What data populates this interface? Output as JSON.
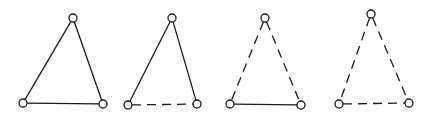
{
  "diagram": {
    "colors": {
      "stroke": "#1a1a1a",
      "node_fill": "#ffffff",
      "background": "#ffffff"
    },
    "node_radius": 4,
    "triangles": [
      {
        "id": "triangle-1",
        "vertices": {
          "apex": [
            73,
            18
          ],
          "bottom_left": [
            23,
            103
          ],
          "bottom_right": [
            103,
            104
          ]
        },
        "edges": {
          "left": "solid",
          "right": "solid",
          "base": "solid"
        }
      },
      {
        "id": "triangle-2",
        "vertices": {
          "apex": [
            172,
            18
          ],
          "bottom_left": [
            128,
            105
          ],
          "bottom_right": [
            197,
            104
          ]
        },
        "edges": {
          "left": "solid",
          "right": "solid",
          "base": "dashed"
        }
      },
      {
        "id": "triangle-3",
        "vertices": {
          "apex": [
            265,
            18
          ],
          "bottom_left": [
            230,
            104
          ],
          "bottom_right": [
            301,
            105
          ]
        },
        "edges": {
          "left": "dashed",
          "right": "dashed",
          "base": "solid"
        }
      },
      {
        "id": "triangle-4",
        "vertices": {
          "apex": [
            371,
            14
          ],
          "bottom_left": [
            339,
            104
          ],
          "bottom_right": [
            409,
            103
          ]
        },
        "edges": {
          "left": "dashed",
          "right": "dashed",
          "base": "dashed"
        }
      }
    ]
  }
}
